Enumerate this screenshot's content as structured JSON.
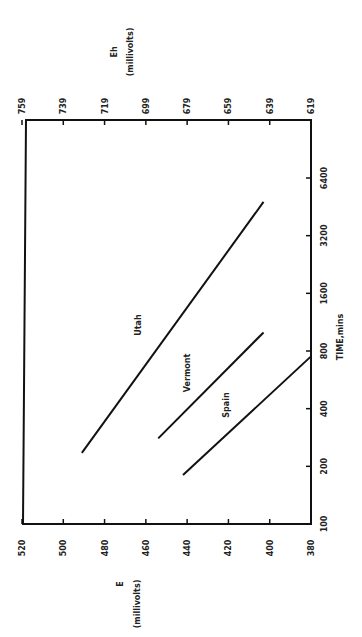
{
  "chart_data": {
    "type": "line",
    "orientation": "rotated 90 degrees counter-clockwise",
    "title": "",
    "xlabel": "TIME,mins",
    "x_scale": "log",
    "x_ticks": [
      "100",
      "200",
      "400",
      "800",
      "1600",
      "3200",
      "6400"
    ],
    "ylabel_left": "E (millivolts)",
    "y_left_ticks": [
      "520",
      "500",
      "480",
      "460",
      "440",
      "420",
      "400",
      "380"
    ],
    "ylim": [
      380,
      520
    ],
    "ylabel_right": "Eh (millivolts)",
    "y_right_ticks": [
      "759",
      "739",
      "719",
      "699",
      "679",
      "659",
      "639",
      "619"
    ],
    "grid": false,
    "series": [
      {
        "name": "Utah",
        "x": [
          235,
          4800
        ],
        "values": [
          491,
          403
        ]
      },
      {
        "name": "Vermont",
        "x": [
          280,
          1000
        ],
        "values": [
          454,
          403
        ]
      },
      {
        "name": "Spain",
        "x": [
          180,
          750
        ],
        "values": [
          442,
          380
        ]
      }
    ]
  },
  "labels": {
    "time_axis": "TIME,mins",
    "e_axis_title": "E",
    "e_axis_unit": "(millivolts)",
    "eh_axis_title": "Eh",
    "eh_axis_unit": "(millivolts)",
    "utah": "Utah",
    "vermont": "Vermont",
    "spain": "Spain"
  }
}
